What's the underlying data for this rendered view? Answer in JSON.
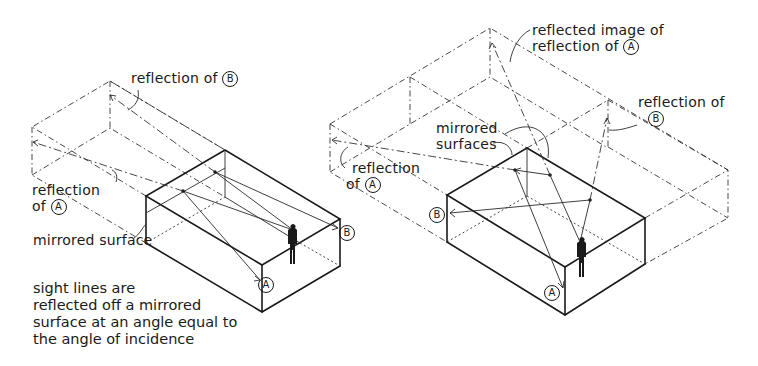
{
  "left_figure": {
    "labels": {
      "reflection_b": "reflection of",
      "reflection_b_marker": "B",
      "reflection_a": "reflection",
      "reflection_a_of": "of",
      "reflection_a_marker": "A",
      "mirrored_surface": "mirrored surface",
      "point_a": "A",
      "point_b": "B"
    },
    "caption": [
      "sight lines are",
      "reflected off a mirrored",
      "surface at an angle equal to",
      "the angle of incidence"
    ]
  },
  "right_figure": {
    "labels": {
      "reflected_image_line1": "reflected image of",
      "reflected_image_line2": "reflection of",
      "reflected_image_marker": "A",
      "reflection_b": "reflection of",
      "reflection_b_marker": "B",
      "mirrored_surfaces_line1": "mirrored",
      "mirrored_surfaces_line2": "surfaces",
      "reflection_a": "reflection",
      "reflection_a_of": "of",
      "reflection_a_marker": "A",
      "point_a": "A",
      "point_b": "B"
    }
  }
}
